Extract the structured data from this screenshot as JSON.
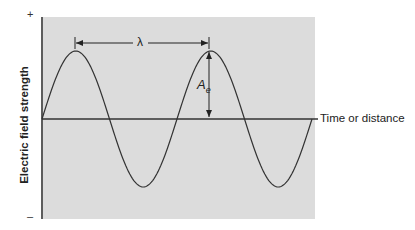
{
  "diagram": {
    "type": "sine-wave",
    "y_axis": {
      "label": "Electric field strength",
      "top_marker": "+",
      "bottom_marker": "–"
    },
    "x_axis": {
      "label": "Time or distance"
    },
    "annotations": {
      "wavelength_symbol": "λ",
      "amplitude_symbol": "A",
      "amplitude_subscript": "e"
    },
    "colors": {
      "plot_background": "#dcdcdc",
      "line": "#333333",
      "page_background": "#ffffff"
    },
    "wave": {
      "periods": 2,
      "start_phase": "zero-crossing rising"
    }
  }
}
